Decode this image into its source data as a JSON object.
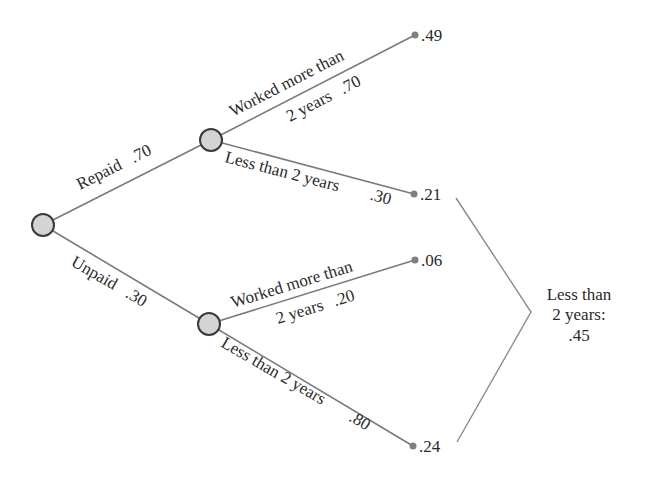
{
  "diagram": {
    "type": "probability-tree",
    "root": {
      "id": "start"
    },
    "level1": {
      "repaid": {
        "label": "Repaid",
        "prob": ".70"
      },
      "unpaid": {
        "label": "Unpaid",
        "prob": ".30"
      }
    },
    "level2": {
      "repaid_worked_line1": "Worked more than",
      "repaid_worked_line2": "2 years",
      "repaid_worked_prob": ".70",
      "repaid_less_label": "Less than 2 years",
      "repaid_less_prob": ".30",
      "unpaid_worked_line1": "Worked more than",
      "unpaid_worked_line2": "2 years",
      "unpaid_worked_prob": ".20",
      "unpaid_less_label": "Less than 2 years",
      "unpaid_less_prob": ".80"
    },
    "leaves": {
      "repaid_worked": ".49",
      "repaid_less": ".21",
      "unpaid_worked": ".06",
      "unpaid_less": ".24"
    },
    "summary": {
      "line1": "Less than",
      "line2": "2 years:",
      "line3": ".45"
    },
    "colors": {
      "node_fill": "#d4d4d4",
      "node_stroke": "#3a3a3a",
      "edge": "#7a7a7a",
      "text": "#2a2a2a"
    }
  }
}
